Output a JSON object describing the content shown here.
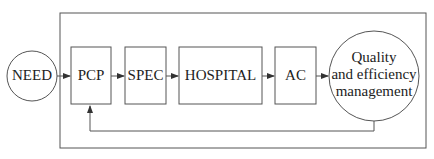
{
  "diagram": {
    "nodes": [
      {
        "id": "need",
        "label": "NEED",
        "shape": "circle"
      },
      {
        "id": "pcp",
        "label": "PCP",
        "shape": "box"
      },
      {
        "id": "spec",
        "label": "SPEC",
        "shape": "box"
      },
      {
        "id": "hospital",
        "label": "HOSPITAL",
        "shape": "box"
      },
      {
        "id": "ac",
        "label": "AC",
        "shape": "box"
      },
      {
        "id": "qem",
        "label_lines": [
          "Quality",
          "and efficiency",
          "management"
        ],
        "shape": "circle"
      }
    ],
    "edges": [
      {
        "from": "need",
        "to": "pcp"
      },
      {
        "from": "pcp",
        "to": "spec"
      },
      {
        "from": "spec",
        "to": "hospital"
      },
      {
        "from": "hospital",
        "to": "ac"
      },
      {
        "from": "ac",
        "to": "qem"
      },
      {
        "from": "qem",
        "to": "pcp",
        "type": "feedback"
      }
    ],
    "colors": {
      "stroke": "#555555",
      "text": "#222222",
      "background": "#ffffff"
    }
  }
}
